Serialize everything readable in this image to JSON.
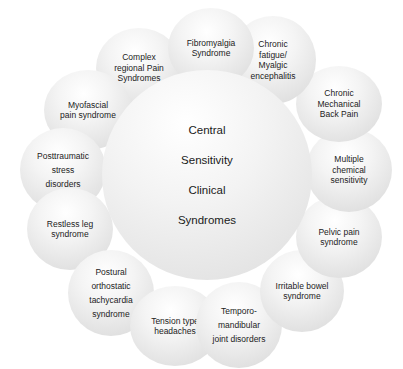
{
  "diagram": {
    "title": "Central Sensitivity Clinical Syndromes",
    "center": {
      "label": "Central\nSensitivity\nClinical\nSyndromes"
    },
    "nodes": [
      {
        "id": "fibromyalgia",
        "label": "Fibromyalgia\nSyndrome"
      },
      {
        "id": "chronic-fatigue",
        "label": "Chronic\nfatigue/\nMyalgic\nencephalitis"
      },
      {
        "id": "chronic-back-pain",
        "label": "Chronic\nMechanical\nBack Pain"
      },
      {
        "id": "multiple-chemical",
        "label": "Multiple\nchemical\nsensitivity"
      },
      {
        "id": "pelvic-pain",
        "label": "Pelvic pain\nsyndrome"
      },
      {
        "id": "irritable-bowel",
        "label": "Irritable bowel\nsyndrome"
      },
      {
        "id": "tmj",
        "label": "Temporo-\nmandibular\njoint disorders"
      },
      {
        "id": "tension-headache",
        "label": "Tension type\nheadaches"
      },
      {
        "id": "pots",
        "label": "Postural\northostatic\ntachycardia\nsyndrome"
      },
      {
        "id": "restless-leg",
        "label": "Restless leg\nsyndrome"
      },
      {
        "id": "ptsd",
        "label": "Posttraumatic\nstress\ndisorders"
      },
      {
        "id": "myofascial",
        "label": "Myofascial\npain syndrome"
      },
      {
        "id": "crps",
        "label": "Complex\nregional Pain\nSyndromes"
      }
    ]
  }
}
